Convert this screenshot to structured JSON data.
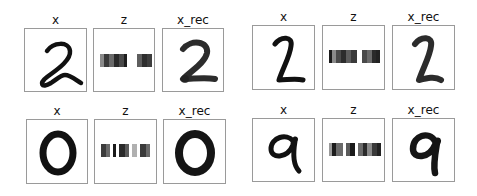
{
  "figure": {
    "groups": [
      {
        "id": "top-left",
        "digit": "2",
        "panels": [
          {
            "title": "x",
            "kind": "image"
          },
          {
            "title": "z",
            "kind": "latent"
          },
          {
            "title": "x_rec",
            "kind": "image"
          }
        ],
        "z_cells": [
          "#5a5a5a",
          "#3a3a3a",
          "#6a6a6a",
          "#2a2a2a",
          "#4a4a4a",
          "#1e1e1e",
          "#ffffff",
          "#ffffff",
          "#5e5e5e",
          "#2e2e2e"
        ]
      },
      {
        "id": "top-right",
        "digit": "2",
        "panels": [
          {
            "title": "x",
            "kind": "image"
          },
          {
            "title": "z",
            "kind": "latent"
          },
          {
            "title": "x_rec",
            "kind": "image"
          }
        ],
        "z_cells": [
          "#1c1c1c",
          "#8a8a8a",
          "#4a4a4a",
          "#2c2c2c",
          "#5c5c5c",
          "#3a3a3a",
          "#ffffff",
          "#4a4a4a",
          "#6a6a6a",
          "#222222"
        ]
      },
      {
        "id": "bottom-left",
        "digit": "0",
        "panels": [
          {
            "title": "x",
            "kind": "image"
          },
          {
            "title": "z",
            "kind": "latent"
          },
          {
            "title": "x_rec",
            "kind": "image"
          }
        ],
        "z_cells": [
          "#3c3c3c",
          "#6a6a6a",
          "#ffffff",
          "#1a1a1a",
          "#ffffff",
          "#2a2a2a",
          "#5a5a5a",
          "#ffffff",
          "#b0b0b0",
          "#ffffff",
          "#3a3a3a",
          "#6a6a6a"
        ]
      },
      {
        "id": "bottom-right",
        "digit": "9",
        "panels": [
          {
            "title": "x",
            "kind": "image"
          },
          {
            "title": "z",
            "kind": "latent"
          },
          {
            "title": "x_rec",
            "kind": "image"
          }
        ],
        "z_cells": [
          "#9a9a9a",
          "#1c1c1c",
          "#6a6a6a",
          "#ffffff",
          "#5a5a5a",
          "#1a1a1a",
          "#ffffff",
          "#6a6a6a",
          "#2a2a2a",
          "#8a8a8a",
          "#3a3a3a"
        ]
      }
    ],
    "labels": {
      "input": "x",
      "latent": "z",
      "reconstruction": "x_rec"
    }
  }
}
